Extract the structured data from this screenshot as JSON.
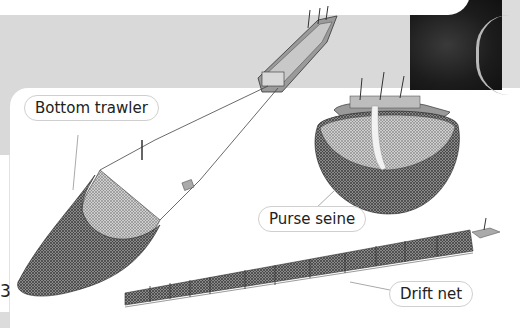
{
  "illustration": {
    "labels": {
      "bottom_trawler": "Bottom trawler",
      "purse_seine": "Purse seine",
      "drift_net": "Drift net"
    },
    "page_number": "3"
  },
  "colors": {
    "background_gray": "#d9d9d9",
    "card_white": "#ffffff",
    "net_dark": "#555555",
    "line": "#444444"
  }
}
